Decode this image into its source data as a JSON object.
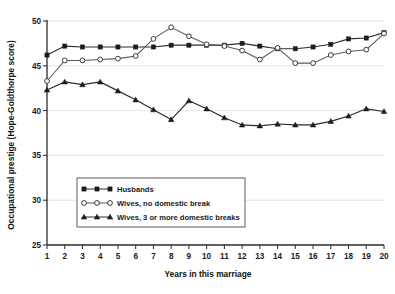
{
  "chart_data": {
    "type": "line",
    "title": "",
    "xlabel": "Years in this marriage",
    "ylabel": "Occupational prestige (Hope-Goldthorpe score)",
    "xlim": [
      1,
      20
    ],
    "ylim": [
      25,
      50
    ],
    "yticks": [
      25,
      30,
      35,
      40,
      45,
      50
    ],
    "xticks": [
      1,
      2,
      3,
      4,
      5,
      6,
      7,
      8,
      9,
      10,
      11,
      12,
      13,
      14,
      15,
      16,
      17,
      18,
      19,
      20
    ],
    "grid": true,
    "legend_position": "lower-center",
    "x": [
      1,
      2,
      3,
      4,
      5,
      6,
      7,
      8,
      9,
      10,
      11,
      12,
      13,
      14,
      15,
      16,
      17,
      18,
      19,
      20
    ],
    "series": [
      {
        "name": "Husbands",
        "marker": "filled-square",
        "values": [
          46.2,
          47.2,
          47.1,
          47.1,
          47.1,
          47.1,
          47.1,
          47.3,
          47.3,
          47.3,
          47.3,
          47.5,
          47.2,
          46.9,
          46.9,
          47.1,
          47.4,
          48.0,
          48.1,
          48.7
        ]
      },
      {
        "name": "Wives, no domestic break",
        "marker": "open-circle",
        "values": [
          43.3,
          45.6,
          45.6,
          45.7,
          45.8,
          46.1,
          48.0,
          49.3,
          48.3,
          47.4,
          47.2,
          46.7,
          45.7,
          47.0,
          45.3,
          45.3,
          46.2,
          46.6,
          46.8,
          48.6
        ]
      },
      {
        "name": "Wives, 3 or more domestic breaks",
        "marker": "filled-triangle",
        "values": [
          42.3,
          43.2,
          42.9,
          43.2,
          42.2,
          41.2,
          40.1,
          39.0,
          41.1,
          40.2,
          39.2,
          38.4,
          38.3,
          38.5,
          38.4,
          38.4,
          38.8,
          39.4,
          40.2,
          39.9
        ]
      }
    ]
  },
  "legend": {
    "items": [
      {
        "label": "Husbands",
        "marker": "filled-square"
      },
      {
        "label": "Wives, no domestic break",
        "marker": "open-circle"
      },
      {
        "label": "Wives, 3 or more domestic breaks",
        "marker": "filled-triangle"
      }
    ]
  }
}
